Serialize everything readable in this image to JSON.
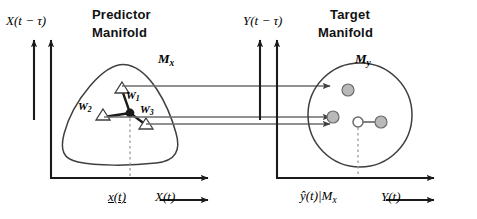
{
  "figure": {
    "kind": "schematic-diagram",
    "colors": {
      "stroke": "#3f3f3f",
      "dark": "#1a1a1a",
      "node_fill": "#b9b9b9",
      "dotted": "#9a9a9a"
    }
  },
  "left_panel": {
    "title_line1": "Predictor",
    "title_line2": "Manifold",
    "y_axis_label": "X(t − τ)",
    "manifold_label_base": "M",
    "manifold_label_sub": "x",
    "x_axis_point_label": "x(t)",
    "x_axis_label": "X(t)",
    "weights": [
      {
        "name": "W",
        "sub": "1"
      },
      {
        "name": "W",
        "sub": "2"
      },
      {
        "name": "W",
        "sub": "3"
      }
    ]
  },
  "right_panel": {
    "title_line1": "Target",
    "title_line2": "Manifold",
    "y_axis_label": "Y(t − τ)",
    "manifold_label_base": "M",
    "manifold_label_sub": "y",
    "x_axis_point_label_base": "ŷ(t)|M",
    "x_axis_point_label_sub": "x",
    "x_axis_label": "Y(t)"
  }
}
